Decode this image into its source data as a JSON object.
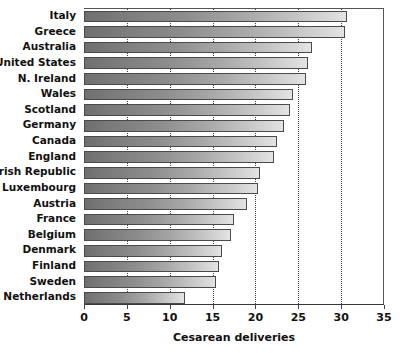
{
  "chart_data": {
    "type": "bar",
    "orientation": "horizontal",
    "title": "",
    "xlabel": "Cesarean deliveries",
    "ylabel": "",
    "xlim": [
      0,
      35
    ],
    "xticks": [
      0,
      5,
      10,
      15,
      20,
      25,
      30,
      35
    ],
    "xtick_labels": [
      "0",
      "5",
      "10",
      "15",
      "20",
      "25",
      "30",
      "35"
    ],
    "grid": "vertical-dotted",
    "legend": "none",
    "categories": [
      "Italy",
      "Greece",
      "Australia",
      "United States",
      "N. Ireland",
      "Wales",
      "Scotland",
      "Germany",
      "Canada",
      "England",
      "Irish Republic",
      "Luxembourg",
      "Austria",
      "France",
      "Belgium",
      "Denmark",
      "Finland",
      "Sweden",
      "Netherlands"
    ],
    "values": [
      30.7,
      30.5,
      26.6,
      26.1,
      25.9,
      24.4,
      24.0,
      23.3,
      22.5,
      22.2,
      20.5,
      20.3,
      19.0,
      17.5,
      17.1,
      16.1,
      15.8,
      15.4,
      11.8
    ],
    "colors": {
      "bar_gradient_start": "#6f6f6f",
      "bar_gradient_end": "#e4e4e4",
      "bar_border": "#4a4a4a",
      "axis": "#3a3a3a",
      "gridline": "#3f3f3f",
      "text": "#111111",
      "background": "#ffffff"
    }
  }
}
